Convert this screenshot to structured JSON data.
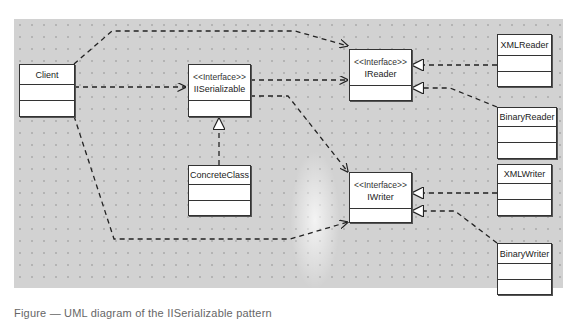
{
  "diagram": {
    "type": "UML class diagram",
    "stereotype_label": "<<Interface>>",
    "classes": [
      {
        "id": "client",
        "name": "Client",
        "stereotype": null
      },
      {
        "id": "iserializable",
        "name": "IISerializable",
        "stereotype": "<<Interface>>"
      },
      {
        "id": "ireader",
        "name": "IReader",
        "stereotype": "<<Interface>>"
      },
      {
        "id": "iwriter",
        "name": "IWriter",
        "stereotype": "<<Interface>>"
      },
      {
        "id": "concreteclass",
        "name": "ConcreteClass",
        "stereotype": null
      },
      {
        "id": "xmlreader",
        "name": "XMLReader",
        "stereotype": null
      },
      {
        "id": "binaryreader",
        "name": "BinaryReader",
        "stereotype": null
      },
      {
        "id": "xmlwriter",
        "name": "XMLWriter",
        "stereotype": null
      },
      {
        "id": "binarywriter",
        "name": "BinaryWriter",
        "stereotype": null
      }
    ],
    "relationships": [
      {
        "from": "Client",
        "to": "IISerializable",
        "kind": "dependency"
      },
      {
        "from": "Client",
        "to": "IReader",
        "kind": "dependency"
      },
      {
        "from": "Client",
        "to": "IWriter",
        "kind": "dependency"
      },
      {
        "from": "IISerializable",
        "to": "IReader",
        "kind": "dependency"
      },
      {
        "from": "IISerializable",
        "to": "IWriter",
        "kind": "dependency"
      },
      {
        "from": "ConcreteClass",
        "to": "IISerializable",
        "kind": "realization"
      },
      {
        "from": "XMLReader",
        "to": "IReader",
        "kind": "realization"
      },
      {
        "from": "BinaryReader",
        "to": "IReader",
        "kind": "realization"
      },
      {
        "from": "XMLWriter",
        "to": "IWriter",
        "kind": "realization"
      },
      {
        "from": "BinaryWriter",
        "to": "IWriter",
        "kind": "realization"
      }
    ],
    "colors": {
      "canvas": "#d2d2d2",
      "box_fill": "#ffffff",
      "line": "#222222"
    }
  },
  "caption": {
    "text": "Figure — UML diagram of the IISerializable pattern",
    "note": "caption partially cropped at bottom edge"
  }
}
